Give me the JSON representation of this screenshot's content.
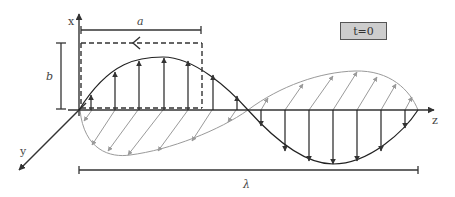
{
  "time_label": "t=0",
  "axes": {
    "x_label": "x",
    "y_label": "y",
    "z_label": "z"
  },
  "dimensions": {
    "a_label": "a",
    "b_label": "b",
    "wavelength_label": "λ"
  },
  "waves": [
    {
      "name": "electric-field",
      "color": "#222222",
      "plane": "x-z",
      "arrows": "vertical"
    },
    {
      "name": "magnetic-field",
      "color": "#9a9a9a",
      "plane": "y-z",
      "arrows": "diagonal"
    }
  ],
  "colors": {
    "axis": "#333333",
    "primary_wave": "#222222",
    "secondary_wave": "#9a9a9a",
    "time_box_fill": "#cdcdcd"
  }
}
